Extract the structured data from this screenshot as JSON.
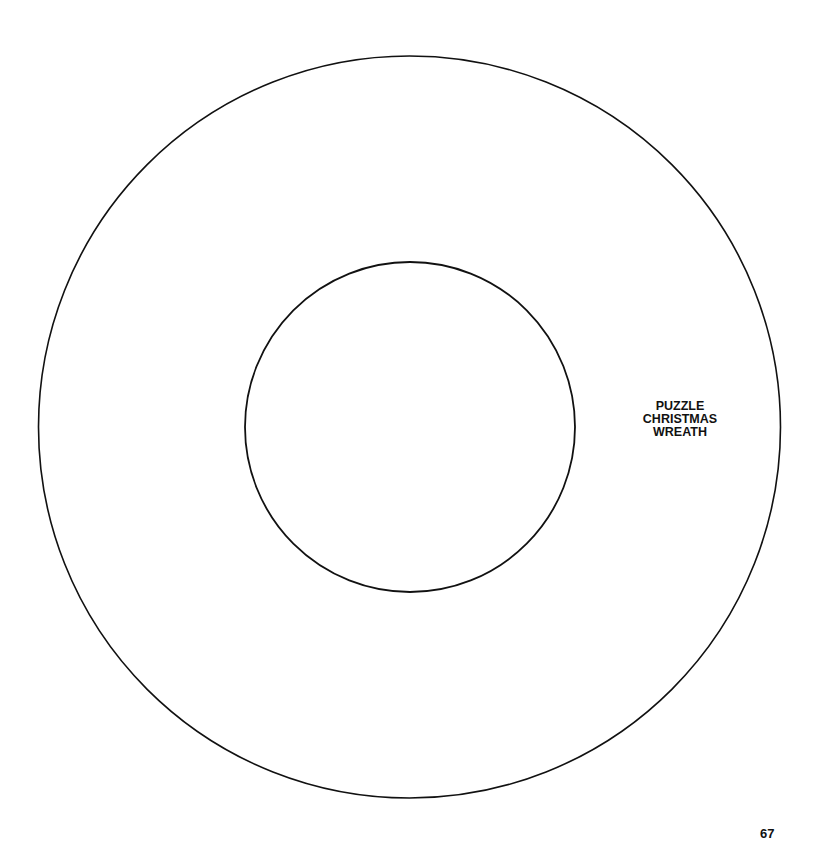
{
  "pattern": {
    "name": "Puzzle Christmas Wreath",
    "shape": "ring",
    "line_color": "#111111",
    "background_color": "#ffffff"
  },
  "title": {
    "lines": [
      "PUZZLE",
      "CHRISTMAS",
      "WREATH"
    ]
  },
  "page_number": "67"
}
